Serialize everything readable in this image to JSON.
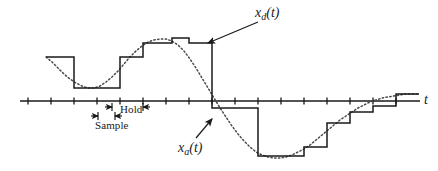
{
  "figure": {
    "background": "#ffffff",
    "ink": "#1a1a1a",
    "width": 438,
    "height": 171
  },
  "labels": {
    "xd": {
      "base": "x",
      "sub": "d",
      "arg": "(t)",
      "text": "x_d(t)",
      "x": 255,
      "y": 5
    },
    "xa": {
      "base": "x",
      "sub": "a",
      "arg": "(t)",
      "text": "x_a(t)",
      "x": 178,
      "y": 140
    },
    "taxis": {
      "text": "t",
      "x": 424,
      "y": 92
    },
    "hold": {
      "text": "Hold",
      "x": 120,
      "y": 103
    },
    "sample": {
      "text": "Sample",
      "x": 95,
      "y": 119
    }
  },
  "axis": {
    "name": "time-axis",
    "y": 101,
    "x_start": 20,
    "x_end": 420,
    "tick_spacing": 23,
    "tick_half_height": 3.5,
    "tick_positions": [
      28,
      51,
      74,
      97,
      120,
      143,
      166,
      189,
      212,
      235,
      258,
      281,
      304,
      327,
      350,
      373,
      396
    ],
    "grid": false
  },
  "markers": {
    "hold_span": {
      "x1": 112,
      "x2": 143,
      "y": 107,
      "label": "Hold"
    },
    "sample_span": {
      "x1": 98,
      "x2": 115,
      "y": 116,
      "label": "Sample"
    }
  },
  "leaders": {
    "xd_leader": {
      "from_x": 258,
      "from_y": 22,
      "to_x": 208,
      "to_y": 43
    },
    "xa_leader": {
      "from_x": 196,
      "from_y": 138,
      "to_x": 212,
      "to_y": 119
    }
  },
  "chart_data": {
    "type": "line",
    "title": "",
    "xlabel": "t",
    "ylabel": "",
    "grid": false,
    "legend": [
      "x_d(t)",
      "x_a(t)"
    ],
    "legend_position": "annotated-callouts",
    "axis_y_pixel": 101,
    "series": [
      {
        "name": "x_a(t)",
        "style": "dotted",
        "description": "Continuous analog signal, one cycle of a smooth oscillation: starts high-positive, dips to a negative trough, rises to a broad positive crest, falls through zero near the middle, reaches a deep negative trough, then rises back toward a positive level at the right edge.",
        "points": [
          [
            46,
            57
          ],
          [
            52,
            62
          ],
          [
            58,
            68
          ],
          [
            64,
            74
          ],
          [
            70,
            79
          ],
          [
            76,
            83
          ],
          [
            82,
            86
          ],
          [
            88,
            88
          ],
          [
            94,
            88
          ],
          [
            100,
            86
          ],
          [
            106,
            82
          ],
          [
            112,
            77
          ],
          [
            118,
            71
          ],
          [
            124,
            64
          ],
          [
            130,
            57
          ],
          [
            136,
            51
          ],
          [
            142,
            46
          ],
          [
            148,
            42
          ],
          [
            154,
            40
          ],
          [
            160,
            39
          ],
          [
            166,
            39
          ],
          [
            172,
            41
          ],
          [
            178,
            45
          ],
          [
            184,
            51
          ],
          [
            190,
            59
          ],
          [
            196,
            68
          ],
          [
            202,
            78
          ],
          [
            208,
            88
          ],
          [
            214,
            98
          ],
          [
            220,
            108
          ],
          [
            226,
            117
          ],
          [
            232,
            126
          ],
          [
            238,
            134
          ],
          [
            244,
            141
          ],
          [
            250,
            147
          ],
          [
            256,
            152
          ],
          [
            262,
            155
          ],
          [
            268,
            157
          ],
          [
            274,
            158
          ],
          [
            280,
            158
          ],
          [
            286,
            157
          ],
          [
            292,
            155
          ],
          [
            298,
            152
          ],
          [
            304,
            149
          ],
          [
            310,
            145
          ],
          [
            316,
            140
          ],
          [
            322,
            135
          ],
          [
            328,
            130
          ],
          [
            334,
            125
          ],
          [
            340,
            120
          ],
          [
            346,
            116
          ],
          [
            352,
            112
          ],
          [
            358,
            108
          ],
          [
            364,
            105
          ],
          [
            370,
            102
          ],
          [
            376,
            100
          ],
          [
            382,
            98
          ],
          [
            388,
            97
          ],
          [
            394,
            96
          ],
          [
            400,
            95
          ],
          [
            406,
            94
          ],
          [
            412,
            94
          ],
          [
            418,
            94
          ]
        ]
      },
      {
        "name": "x_d(t)",
        "style": "solid-staircase",
        "description": "Sample-and-hold (zero-order-hold) staircase version of x_a(t); each step holds the sampled value for one sampling interval.",
        "steps": [
          {
            "x1": 46,
            "x2": 74,
            "y": 57
          },
          {
            "x1": 74,
            "x2": 97,
            "y": 88
          },
          {
            "x1": 97,
            "x2": 120,
            "y": 88
          },
          {
            "x1": 120,
            "x2": 143,
            "y": 57
          },
          {
            "x1": 143,
            "x2": 166,
            "y": 43
          },
          {
            "x1": 166,
            "x2": 172,
            "y": 43
          },
          {
            "x1": 172,
            "x2": 189,
            "y": 38
          },
          {
            "x1": 189,
            "x2": 212,
            "y": 43
          },
          {
            "x1": 212,
            "x2": 235,
            "y": 108
          },
          {
            "x1": 235,
            "x2": 258,
            "y": 108
          },
          {
            "x1": 258,
            "x2": 281,
            "y": 156
          },
          {
            "x1": 281,
            "x2": 304,
            "y": 156
          },
          {
            "x1": 304,
            "x2": 327,
            "y": 147
          },
          {
            "x1": 327,
            "x2": 350,
            "y": 123
          },
          {
            "x1": 350,
            "x2": 373,
            "y": 112
          },
          {
            "x1": 373,
            "x2": 396,
            "y": 106
          },
          {
            "x1": 396,
            "x2": 419,
            "y": 94
          }
        ]
      }
    ]
  }
}
